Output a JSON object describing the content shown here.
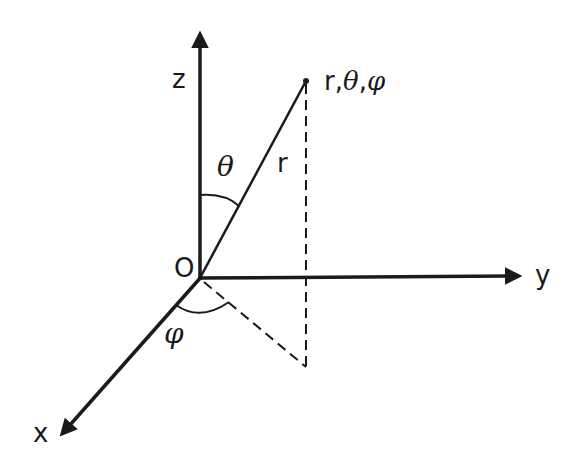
{
  "diagram": {
    "colors": {
      "ink": "#1a1a1a",
      "background": "#ffffff"
    },
    "labels": {
      "z_axis": "z",
      "y_axis": "y",
      "x_axis": "x",
      "origin": "O",
      "radius": "r",
      "theta": "θ",
      "phi": "φ",
      "point_r": "r,",
      "point_theta": "θ",
      "point_comma": ",",
      "point_phi": "φ"
    },
    "geometry": {
      "origin": [
        200,
        278
      ],
      "z_tip": [
        200,
        30
      ],
      "y_tip": [
        523,
        276
      ],
      "x_tip": [
        58,
        438
      ],
      "point": [
        306,
        81
      ],
      "projection": [
        306,
        367
      ]
    }
  }
}
